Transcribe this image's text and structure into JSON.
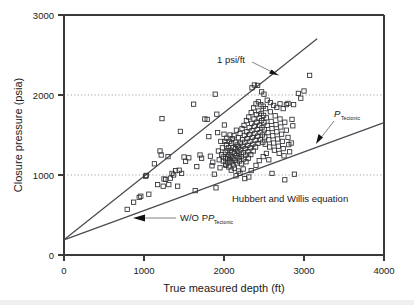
{
  "chart_data": {
    "type": "scatter",
    "title": "",
    "xlabel": "True measured depth (ft)",
    "ylabel": "Closure pressure (psia)",
    "xlim": [
      0,
      4000
    ],
    "ylim": [
      0,
      3000
    ],
    "xticks": [
      0,
      1000,
      2000,
      3000,
      4000
    ],
    "yticks": [
      0,
      1000,
      2000,
      3000
    ],
    "xtick_labels": [
      "0",
      "1000",
      "2000",
      "3000",
      "4000"
    ],
    "ytick_labels": [
      "0",
      "1000",
      "2000",
      "3000"
    ],
    "grid": "horizontal dotted gridlines at y = 1000 and y = 2000",
    "legend": "none",
    "marker": "open square",
    "series": [
      {
        "name": "Closure pressure measurements",
        "marker": "open-square",
        "points": [
          [
            790,
            570
          ],
          [
            870,
            660
          ],
          [
            940,
            720
          ],
          [
            960,
            735
          ],
          [
            1020,
            985
          ],
          [
            1030,
            995
          ],
          [
            1060,
            760
          ],
          [
            1130,
            1140
          ],
          [
            1170,
            880
          ],
          [
            1200,
            1300
          ],
          [
            1215,
            1250
          ],
          [
            1225,
            1705
          ],
          [
            1240,
            860
          ],
          [
            1250,
            950
          ],
          [
            1270,
            945
          ],
          [
            1300,
            1230
          ],
          [
            1310,
            880
          ],
          [
            1330,
            960
          ],
          [
            1350,
            1020
          ],
          [
            1370,
            1000
          ],
          [
            1395,
            1055
          ],
          [
            1420,
            860
          ],
          [
            1440,
            1060
          ],
          [
            1455,
            1545
          ],
          [
            1470,
            1020
          ],
          [
            1500,
            1225
          ],
          [
            1520,
            1170
          ],
          [
            1560,
            1215
          ],
          [
            1620,
            1885
          ],
          [
            1640,
            805
          ],
          [
            1660,
            1105
          ],
          [
            1700,
            1250
          ],
          [
            1720,
            1210
          ],
          [
            1760,
            1700
          ],
          [
            1790,
            1695
          ],
          [
            1810,
            1480
          ],
          [
            1830,
            1235
          ],
          [
            1850,
            1115
          ],
          [
            1860,
            1160
          ],
          [
            1880,
            1010
          ],
          [
            1890,
            2010
          ],
          [
            1900,
            840
          ],
          [
            1910,
            1760
          ],
          [
            1920,
            1530
          ],
          [
            1930,
            1300
          ],
          [
            1940,
            1190
          ],
          [
            1950,
            1090
          ],
          [
            1960,
            1420
          ],
          [
            1970,
            1255
          ],
          [
            1980,
            1340
          ],
          [
            1990,
            1175
          ],
          [
            2000,
            1510
          ],
          [
            2005,
            1625
          ],
          [
            2010,
            1420
          ],
          [
            2015,
            1285
          ],
          [
            2020,
            1205
          ],
          [
            2025,
            1120
          ],
          [
            2030,
            1380
          ],
          [
            2035,
            1460
          ],
          [
            2040,
            1305
          ],
          [
            2045,
            1225
          ],
          [
            2050,
            1155
          ],
          [
            2055,
            1340
          ],
          [
            2060,
            1250
          ],
          [
            2065,
            1420
          ],
          [
            2070,
            1190
          ],
          [
            2075,
            1500
          ],
          [
            2080,
            1310
          ],
          [
            2085,
            1235
          ],
          [
            2090,
            1165
          ],
          [
            2095,
            1395
          ],
          [
            2100,
            1280
          ],
          [
            2105,
            1455
          ],
          [
            2110,
            1210
          ],
          [
            2115,
            1345
          ],
          [
            2120,
            1125
          ],
          [
            2125,
            1490
          ],
          [
            2130,
            1270
          ],
          [
            2135,
            1185
          ],
          [
            2140,
            1410
          ],
          [
            2145,
            1330
          ],
          [
            2150,
            1240
          ],
          [
            2155,
            1560
          ],
          [
            2160,
            1150
          ],
          [
            2165,
            1375
          ],
          [
            2170,
            1295
          ],
          [
            2175,
            1215
          ],
          [
            2180,
            1465
          ],
          [
            2185,
            1350
          ],
          [
            2190,
            1260
          ],
          [
            2195,
            1175
          ],
          [
            2200,
            1520
          ],
          [
            2205,
            1400
          ],
          [
            2210,
            1315
          ],
          [
            2215,
            1230
          ],
          [
            2220,
            1140
          ],
          [
            2225,
            1580
          ],
          [
            2230,
            1440
          ],
          [
            2235,
            1360
          ],
          [
            2240,
            1280
          ],
          [
            2245,
            1200
          ],
          [
            2250,
            1620
          ],
          [
            2255,
            1495
          ],
          [
            2260,
            1410
          ],
          [
            2265,
            1330
          ],
          [
            2270,
            1250
          ],
          [
            2275,
            1165
          ],
          [
            2280,
            1680
          ],
          [
            2285,
            1540
          ],
          [
            2290,
            1455
          ],
          [
            2295,
            1370
          ],
          [
            2300,
            1290
          ],
          [
            2305,
            1210
          ],
          [
            2310,
            1725
          ],
          [
            2315,
            1590
          ],
          [
            2320,
            1505
          ],
          [
            2325,
            1420
          ],
          [
            2330,
            1340
          ],
          [
            2335,
            1255
          ],
          [
            2340,
            1780
          ],
          [
            2345,
            1645
          ],
          [
            2350,
            1555
          ],
          [
            2355,
            1470
          ],
          [
            2360,
            1385
          ],
          [
            2365,
            1300
          ],
          [
            2370,
            1840
          ],
          [
            2375,
            1700
          ],
          [
            2380,
            1610
          ],
          [
            2385,
            1520
          ],
          [
            2390,
            1435
          ],
          [
            2395,
            1350
          ],
          [
            2400,
            1890
          ],
          [
            2405,
            1755
          ],
          [
            2410,
            1660
          ],
          [
            2415,
            1570
          ],
          [
            2420,
            1485
          ],
          [
            2425,
            1395
          ],
          [
            2430,
            1915
          ],
          [
            2435,
            1800
          ],
          [
            2440,
            1710
          ],
          [
            2445,
            1620
          ],
          [
            2450,
            1530
          ],
          [
            2455,
            1440
          ],
          [
            2460,
            1880
          ],
          [
            2465,
            1770
          ],
          [
            2470,
            1680
          ],
          [
            2475,
            1590
          ],
          [
            2480,
            1500
          ],
          [
            2485,
            1410
          ],
          [
            2490,
            1860
          ],
          [
            2495,
            1745
          ],
          [
            2500,
            1655
          ],
          [
            2505,
            1565
          ],
          [
            2510,
            1475
          ],
          [
            2515,
            1385
          ],
          [
            2520,
            1830
          ],
          [
            2530,
            1715
          ],
          [
            2540,
            1620
          ],
          [
            2550,
            1530
          ],
          [
            2560,
            1440
          ],
          [
            2570,
            1350
          ],
          [
            2580,
            1790
          ],
          [
            2590,
            1670
          ],
          [
            2600,
            1580
          ],
          [
            2610,
            1490
          ],
          [
            2620,
            1400
          ],
          [
            2630,
            1310
          ],
          [
            2640,
            1740
          ],
          [
            2650,
            1630
          ],
          [
            2660,
            1540
          ],
          [
            2670,
            1450
          ],
          [
            2680,
            1360
          ],
          [
            2690,
            1270
          ],
          [
            2700,
            1700
          ],
          [
            2710,
            1600
          ],
          [
            2720,
            1510
          ],
          [
            2730,
            1420
          ],
          [
            2740,
            1330
          ],
          [
            2750,
            1240
          ],
          [
            2760,
            1660
          ],
          [
            2780,
            1560
          ],
          [
            2800,
            1470
          ],
          [
            2810,
            1380
          ],
          [
            2820,
            1290
          ],
          [
            2840,
            1400
          ],
          [
            2850,
            1695
          ],
          [
            2860,
            1615
          ],
          [
            2870,
            1880
          ],
          [
            2880,
            1010
          ],
          [
            2760,
            940
          ],
          [
            2600,
            1020
          ],
          [
            2380,
            2125
          ],
          [
            2420,
            2120
          ],
          [
            2350,
            2090
          ],
          [
            2470,
            2040
          ],
          [
            2500,
            2010
          ],
          [
            2540,
            1935
          ],
          [
            2580,
            1905
          ],
          [
            2620,
            1870
          ],
          [
            2660,
            1845
          ],
          [
            2700,
            1890
          ],
          [
            2740,
            1830
          ],
          [
            2780,
            1880
          ],
          [
            2800,
            1895
          ],
          [
            2930,
            2020
          ],
          [
            2960,
            1960
          ],
          [
            3000,
            2050
          ],
          [
            3070,
            2245
          ],
          [
            2180,
            1050
          ],
          [
            2200,
            1020
          ],
          [
            2240,
            1075
          ],
          [
            2090,
            1060
          ],
          [
            2130,
            1085
          ],
          [
            2060,
            1100
          ],
          [
            2150,
            990
          ],
          [
            2260,
            955
          ],
          [
            2310,
            975
          ],
          [
            2020,
            1135
          ],
          [
            1990,
            1225
          ],
          [
            2440,
            1180
          ],
          [
            2490,
            1230
          ],
          [
            2530,
            1270
          ],
          [
            2560,
            1190
          ],
          [
            2340,
            1055
          ],
          [
            2400,
            1120
          ]
        ]
      }
    ],
    "reference_lines": [
      {
        "name": "1 psi/ft",
        "label": "1 psi/ft",
        "description": "Upper steep reference line, approximately 1 psi per foot gradient",
        "from": [
          0,
          190
        ],
        "to": [
          3160,
          2700
        ]
      },
      {
        "name": "Hubbert and Willis equation without tectonic pressure",
        "label": "Hubbert and Willis equation",
        "sub_label": "W/O P",
        "sub_label_subscript": "Tectonic",
        "description": "Lower reference line representing the Hubbert and Willis equation without tectonic pressure",
        "from": [
          0,
          190
        ],
        "to": [
          4000,
          1655
        ]
      }
    ],
    "annotations": [
      {
        "name": "one-psi-per-ft",
        "text": "1 psi/ft",
        "points_to": "upper reference line"
      },
      {
        "name": "p-tectonic",
        "text": "P",
        "subscript": "Tectonic",
        "points_to": "lower reference line"
      },
      {
        "name": "hubbert-willis",
        "text": "Hubbert and Willis equation",
        "points_to": "lower reference line region"
      },
      {
        "name": "without-p-tectonic",
        "text": "W/O P",
        "subscript": "Tectonic",
        "points_to": "lower reference line"
      }
    ],
    "colors": {
      "marker_stroke": "#2e2e33",
      "line": "#4a4a52",
      "axis": "#3a3a3a",
      "grid": "#9a9a9a",
      "text": "#1a1a1a",
      "background": "#ffffff"
    }
  }
}
